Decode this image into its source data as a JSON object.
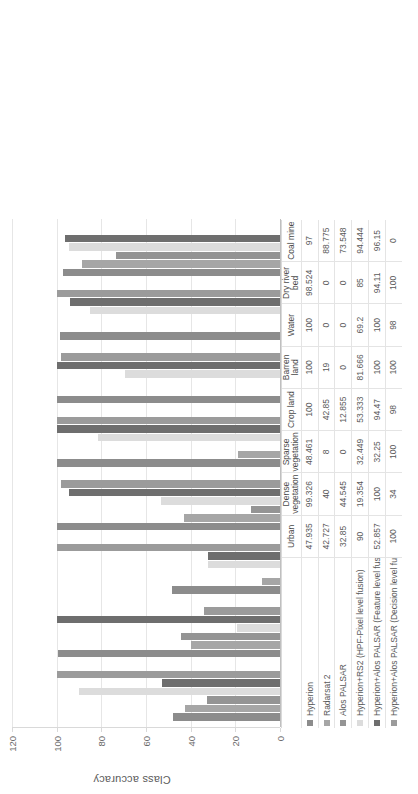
{
  "chart_data": {
    "type": "bar",
    "orientation": "vertical",
    "rotated_90_ccw": true,
    "title": "",
    "xlabel": "",
    "ylabel": "Class accuracy",
    "ylim": [
      0,
      120
    ],
    "yticks": [
      120,
      100,
      80,
      60,
      40,
      20,
      0
    ],
    "grid": true,
    "legend_position": "table-left",
    "categories": [
      "Urban",
      "Dense vegetation",
      "Sparse vegetation",
      "Crop land",
      "Barren land",
      "Water",
      "Dry river bed",
      "Coal mine"
    ],
    "series": [
      {
        "name": "Hyperion",
        "color": "#8c8c8c",
        "values": [
          47.935,
          99.326,
          48.461,
          100,
          100,
          100,
          98.524,
          97
        ],
        "labels": [
          "47.935",
          "99.326",
          "48.461",
          "100",
          "100",
          "100",
          "98.524",
          "97"
        ]
      },
      {
        "name": "Radarsat 2",
        "color": "#a6a6a6",
        "values": [
          42.727,
          40,
          8,
          42.85,
          19,
          0,
          0,
          88.775
        ],
        "labels": [
          "42.727",
          "40",
          "8",
          "42.85",
          "19",
          "0",
          "0",
          "88.775"
        ]
      },
      {
        "name": "Alos PALSAR",
        "color": "#949494",
        "values": [
          32.85,
          44.545,
          0,
          12.855,
          0,
          0,
          0,
          73.548
        ],
        "labels": [
          "32.85",
          "44.545",
          "0",
          "12.855",
          "0",
          "0",
          "0",
          "73.548"
        ]
      },
      {
        "name": "Hyperion+RS2 (HPF-Pixel level fusion)",
        "color": "#dcdcdc",
        "values": [
          90,
          19.354,
          32.449,
          53.333,
          81.666,
          69.2,
          85,
          94.444
        ],
        "labels": [
          "90",
          "19.354",
          "32.449",
          "53.333",
          "81.666",
          "69.2",
          "85",
          "94.444"
        ]
      },
      {
        "name": "Hyperion+Alos PALSAR (Feature level fusion)",
        "color": "#6e6e6e",
        "values": [
          52.857,
          100,
          32.25,
          94.47,
          100,
          100,
          94.11,
          96.15
        ],
        "labels": [
          "52.857",
          "100",
          "32.25",
          "94.47",
          "100",
          "100",
          "94.11",
          "96.15"
        ]
      },
      {
        "name": "Hyperion+Alos PALSAR (Decision level fusion)",
        "color": "#9b9b9b",
        "values": [
          100,
          34,
          100,
          98,
          100,
          98,
          100,
          0
        ],
        "labels": [
          "100",
          "34",
          "100",
          "98",
          "100",
          "98",
          "100",
          "0"
        ]
      }
    ]
  }
}
